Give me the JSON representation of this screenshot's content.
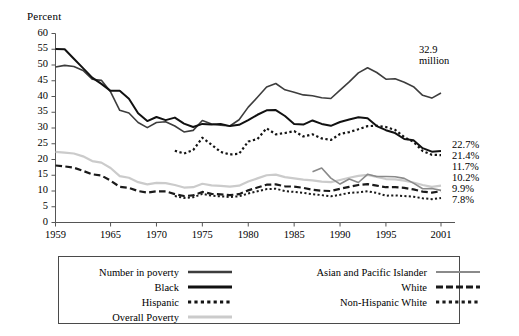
{
  "chart_data": {
    "type": "line",
    "title": "",
    "ylabel": "Percent",
    "xlabel": "",
    "ylim": [
      0,
      60
    ],
    "xlim": [
      1959,
      2001
    ],
    "ytick_labels": [
      "0",
      "5",
      "10",
      "15",
      "20",
      "25",
      "30",
      "35",
      "40",
      "45",
      "50",
      "55",
      "60"
    ],
    "ytick_values": [
      0,
      5,
      10,
      15,
      20,
      25,
      30,
      35,
      40,
      45,
      50,
      55,
      60
    ],
    "xtick_labels": [
      "1959",
      "1965",
      "1970",
      "1975",
      "1980",
      "1985",
      "1990",
      "1995",
      "2001"
    ],
    "xtick_values": [
      1959,
      1965,
      1970,
      1975,
      1980,
      1985,
      1990,
      1995,
      2001
    ],
    "grid": false,
    "legend_position": "below-plot",
    "annotations": [
      {
        "text_line1": "32.9",
        "text_line2": "million",
        "x": 1997.2,
        "y": 46.5
      }
    ],
    "end_labels": [
      {
        "text": "22.7%",
        "series": "Black",
        "value": 22.7
      },
      {
        "text": "21.4%",
        "series": "Hispanic",
        "value": 21.4
      },
      {
        "text": "11.7%",
        "series": "Number in poverty",
        "value": 11.7
      },
      {
        "text": "10.2%",
        "series": "Asian and Pacific Islander",
        "value": 10.2
      },
      {
        "text": "9.9%",
        "series": "White",
        "value": 9.9
      },
      {
        "text": "7.8%",
        "series": "Non-Hispanic White",
        "value": 7.8
      }
    ],
    "x": [
      1959,
      1960,
      1961,
      1962,
      1963,
      1964,
      1965,
      1966,
      1967,
      1968,
      1969,
      1970,
      1971,
      1972,
      1973,
      1974,
      1975,
      1976,
      1977,
      1978,
      1979,
      1980,
      1981,
      1982,
      1983,
      1984,
      1985,
      1986,
      1987,
      1988,
      1989,
      1990,
      1991,
      1992,
      1993,
      1994,
      1995,
      1996,
      1997,
      1998,
      1999,
      2000,
      2001
    ],
    "series": [
      {
        "name": "Number in poverty",
        "style": "solid",
        "color": "#3d3d3d",
        "width": 1.6,
        "units": "millions",
        "values": [
          39.5,
          39.9,
          39.6,
          38.6,
          36.4,
          36.1,
          33.2,
          28.5,
          27.8,
          25.4,
          24.1,
          25.4,
          25.6,
          24.5,
          23.0,
          23.4,
          25.9,
          25.0,
          24.7,
          24.5,
          26.1,
          29.3,
          31.8,
          34.4,
          35.3,
          33.7,
          33.1,
          32.4,
          32.2,
          31.7,
          31.5,
          33.6,
          35.7,
          38.0,
          39.3,
          38.1,
          36.4,
          36.5,
          35.6,
          34.5,
          32.3,
          31.6,
          32.9
        ]
      },
      {
        "name": "Black",
        "style": "solid",
        "color": "#111111",
        "width": 2.0,
        "units": "percent",
        "values": [
          55.1,
          55.0,
          52.0,
          49.0,
          46.0,
          44.0,
          41.8,
          41.8,
          39.3,
          34.7,
          32.2,
          33.5,
          32.5,
          33.3,
          31.4,
          30.3,
          31.3,
          31.1,
          31.3,
          30.6,
          31.0,
          32.5,
          34.2,
          35.6,
          35.7,
          33.8,
          31.3,
          31.1,
          32.4,
          31.3,
          30.7,
          31.9,
          32.7,
          33.4,
          33.1,
          30.6,
          29.3,
          28.4,
          26.5,
          26.1,
          23.6,
          22.5,
          22.7
        ]
      },
      {
        "name": "Hispanic",
        "style": "dotted",
        "color": "#141414",
        "width": 2.2,
        "units": "percent",
        "values": [
          null,
          null,
          null,
          null,
          null,
          null,
          null,
          null,
          null,
          null,
          null,
          null,
          null,
          22.8,
          21.9,
          23.0,
          26.9,
          24.7,
          22.4,
          21.6,
          21.8,
          25.7,
          26.5,
          29.9,
          28.0,
          28.4,
          29.0,
          27.3,
          28.0,
          26.7,
          26.2,
          28.1,
          28.7,
          29.6,
          30.6,
          30.7,
          30.3,
          29.4,
          27.1,
          25.6,
          22.7,
          21.5,
          21.4
        ]
      },
      {
        "name": "Overall Poverty",
        "style": "solid",
        "color": "#cbcbcb",
        "width": 2.2,
        "units": "percent",
        "values": [
          22.4,
          22.2,
          21.9,
          21.0,
          19.5,
          19.0,
          17.3,
          14.7,
          14.2,
          12.8,
          12.1,
          12.6,
          12.5,
          11.9,
          11.1,
          11.2,
          12.3,
          11.8,
          11.6,
          11.4,
          11.7,
          13.0,
          14.0,
          15.0,
          15.2,
          14.4,
          14.0,
          13.6,
          13.4,
          13.0,
          12.8,
          13.5,
          14.2,
          14.8,
          15.1,
          14.5,
          13.8,
          13.7,
          13.3,
          12.7,
          11.9,
          11.3,
          11.7
        ]
      },
      {
        "name": "Asian and Pacific Islander",
        "style": "solid",
        "color": "#8a8a8a",
        "width": 1.6,
        "units": "percent",
        "values": [
          null,
          null,
          null,
          null,
          null,
          null,
          null,
          null,
          null,
          null,
          null,
          null,
          null,
          null,
          null,
          null,
          null,
          null,
          null,
          null,
          null,
          null,
          null,
          null,
          null,
          null,
          null,
          null,
          16.1,
          17.3,
          14.1,
          12.2,
          13.8,
          12.7,
          15.3,
          14.6,
          14.6,
          14.5,
          14.0,
          12.5,
          10.7,
          10.8,
          10.2
        ]
      },
      {
        "name": "White",
        "style": "dashed",
        "color": "#1a1a1a",
        "width": 2.2,
        "units": "percent",
        "values": [
          18.1,
          17.8,
          17.4,
          16.4,
          15.3,
          14.9,
          13.3,
          11.3,
          11.0,
          10.0,
          9.5,
          9.9,
          9.9,
          9.0,
          8.4,
          8.6,
          9.7,
          9.1,
          8.9,
          8.7,
          9.0,
          10.2,
          11.1,
          12.0,
          12.1,
          11.5,
          11.4,
          11.0,
          10.4,
          10.1,
          10.0,
          10.7,
          11.3,
          11.9,
          12.2,
          11.7,
          11.2,
          11.2,
          11.0,
          10.5,
          9.8,
          9.5,
          9.9
        ]
      },
      {
        "name": "Non-Hispanic White",
        "style": "dotted",
        "color": "#1a1a1a",
        "width": 2.0,
        "units": "percent",
        "values": [
          null,
          null,
          null,
          null,
          null,
          null,
          null,
          null,
          null,
          null,
          null,
          null,
          null,
          8.4,
          7.8,
          8.0,
          9.1,
          8.5,
          8.3,
          8.1,
          8.3,
          9.2,
          9.9,
          10.6,
          10.7,
          10.0,
          9.7,
          9.4,
          9.0,
          8.7,
          8.3,
          8.8,
          9.4,
          9.6,
          9.9,
          9.4,
          8.5,
          8.6,
          8.4,
          8.2,
          7.7,
          7.4,
          7.8
        ]
      }
    ]
  },
  "legend": {
    "columns": [
      {
        "entries": [
          {
            "label": "Number in poverty",
            "style": "solid",
            "color": "#3d3d3d",
            "width": 2.6
          },
          {
            "label": "Black",
            "style": "solid",
            "color": "#111111",
            "width": 2.8
          },
          {
            "label": "Hispanic",
            "style": "dotted",
            "color": "#141414",
            "width": 2.8
          },
          {
            "label": "Overall Poverty",
            "style": "solid",
            "color": "#cbcbcb",
            "width": 2.8
          }
        ]
      },
      {
        "entries": [
          {
            "label": "Asian and Pacific Islander",
            "style": "solid",
            "color": "#8a8a8a",
            "width": 2.2
          },
          {
            "label": "White",
            "style": "dashed",
            "color": "#1a1a1a",
            "width": 2.8
          },
          {
            "label": "Non-Hispanic White",
            "style": "dotted",
            "color": "#1a1a1a",
            "width": 2.8
          }
        ]
      }
    ]
  }
}
